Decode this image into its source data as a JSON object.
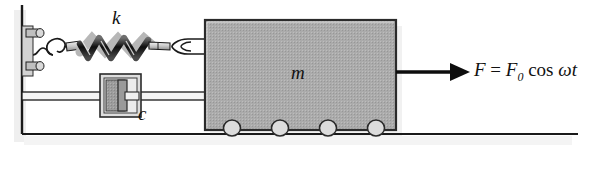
{
  "figure": {
    "labels": {
      "spring_stiffness": "k",
      "damping_coefficient": "c",
      "mass": "m",
      "force_F": "F",
      "force_equals": "=",
      "force_F0": "F",
      "force_F0_sub": "0",
      "force_cos": "cos",
      "force_omega": "ω",
      "force_t": "t",
      "force_expression": "F = F0 cos ωt"
    },
    "components": {
      "wall": "fixed-wall",
      "wall_bracket": "wall-bracket-bolts",
      "spring": "helical-coil-spring",
      "spring_coils": 5,
      "damper": "viscous-damper-dashpot",
      "mass_block": "mass-block",
      "wheels": 4,
      "ground": "ground-line",
      "force_arrow": "force-arrow-right",
      "eye_hook_left": "hook-eye-fitting",
      "eye_hook_right": "eye-bolt-loop"
    },
    "colors": {
      "mass_fill": "#a9a9a9",
      "mass_stroke": "#2b2b2b",
      "damper_fill": "#9e9e9e",
      "damper_body_fill": "#d8d8d8",
      "wheel_fill": "#dcdcdc",
      "line": "#1a1a1a",
      "background": "#ffffff",
      "shadow": "#d9d9d9"
    }
  }
}
